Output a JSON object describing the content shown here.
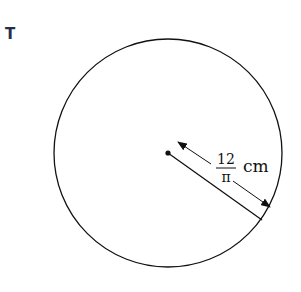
{
  "label_letter": "T",
  "diagram": {
    "shape": "circle",
    "radius_label": {
      "numerator": "12",
      "denominator": "π",
      "unit": "cm"
    },
    "colors": {
      "stroke": "#111111",
      "letter": "#1f2f4d"
    }
  }
}
